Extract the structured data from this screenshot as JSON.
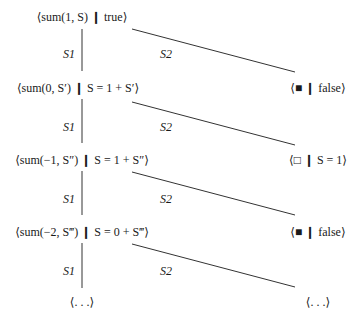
{
  "diagram": {
    "type": "derivation-tree",
    "left_nodes": [
      {
        "id": "n0",
        "text": "⟨sum(1, S) ❙ true⟩"
      },
      {
        "id": "n1",
        "text": "⟨sum(0, S′) ❙ S = 1 + S′⟩"
      },
      {
        "id": "n2",
        "text": "⟨sum(−1, S″) ❙ S = 1 + S″⟩"
      },
      {
        "id": "n3",
        "text": "⟨sum(−2, S‴) ❙ S = 0 + S‴⟩"
      },
      {
        "id": "n4",
        "text": "⟨. . .⟩"
      }
    ],
    "right_nodes": [
      {
        "id": "r1",
        "text": "⟨■ ❙ false⟩"
      },
      {
        "id": "r2",
        "text": "⟨□ ❙ S = 1⟩"
      },
      {
        "id": "r3",
        "text": "⟨■ ❙ false⟩"
      },
      {
        "id": "r4",
        "text": "⟨. . .⟩"
      }
    ],
    "edges": [
      {
        "from": "n0",
        "to": "n1",
        "label": "S1"
      },
      {
        "from": "n0",
        "to": "r1",
        "label": "S2"
      },
      {
        "from": "n1",
        "to": "n2",
        "label": "S1"
      },
      {
        "from": "n1",
        "to": "r2",
        "label": "S2"
      },
      {
        "from": "n2",
        "to": "n3",
        "label": "S1"
      },
      {
        "from": "n2",
        "to": "r3",
        "label": "S2"
      },
      {
        "from": "n3",
        "to": "n4",
        "label": "S1"
      },
      {
        "from": "n3",
        "to": "r4",
        "label": "S2"
      }
    ],
    "line_color": "#333333"
  }
}
